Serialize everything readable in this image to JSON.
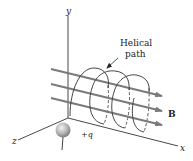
{
  "figure": {
    "axes": {
      "x_label": "x",
      "y_label": "y",
      "z_label": "z"
    },
    "annotation": {
      "line1": "Helical",
      "line2": "path"
    },
    "field_label": "B",
    "charge_label": "+q",
    "colors": {
      "field_lines": "#7a7a7a",
      "axes": "#333333",
      "helix": "#444444",
      "charge_sphere": "#b8b8b8"
    }
  }
}
